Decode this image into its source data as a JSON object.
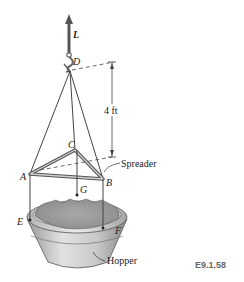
{
  "figure": {
    "force_label": "L",
    "points": {
      "D": "D",
      "C": "C",
      "A": "A",
      "B": "B",
      "G": "G",
      "E": "E",
      "F": "F"
    },
    "dimension_label": "4 ft",
    "callouts": {
      "spreader": "Spreader",
      "hopper": "Hopper"
    },
    "figure_code": "E9.1.58"
  }
}
